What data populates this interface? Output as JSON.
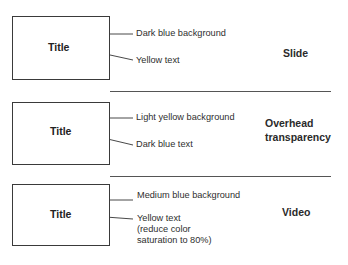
{
  "panels": [
    {
      "medium": "Slide",
      "title": "Title",
      "annotations": [
        "Dark blue background",
        "Yellow text"
      ]
    },
    {
      "medium_line1": "Overhead",
      "medium_line2": "transparency",
      "title": "Title",
      "annotations": [
        "Light yellow background",
        "Dark blue text"
      ]
    },
    {
      "medium": "Video",
      "title": "Title",
      "annotations": [
        "Medium blue background",
        "Yellow text",
        "(reduce color",
        "saturation to 80%)"
      ]
    }
  ]
}
